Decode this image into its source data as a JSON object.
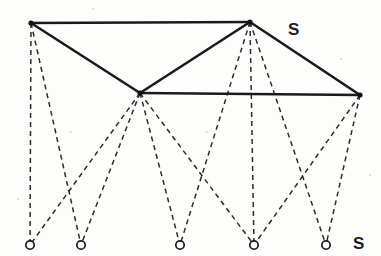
{
  "figure": {
    "width": 381,
    "height": 256,
    "background_color": "#fdfdfb",
    "solid_edge_color": "#1a1a1a",
    "dashed_edge_color": "#2b2b2b",
    "mesh_node_color": "#111111",
    "terminal_node_fill": "#ffffff",
    "terminal_node_stroke": "#1a1a1a"
  },
  "labels": {
    "upper_right": "S",
    "lower_right": "S"
  },
  "chart_data": {
    "type": "diagram",
    "xlabel": "",
    "ylabel": "",
    "mesh_nodes": [
      {
        "id": "n1",
        "name": "top-left-node",
        "x": 31,
        "y": 23
      },
      {
        "id": "n2",
        "name": "middle-node",
        "x": 140,
        "y": 93
      },
      {
        "id": "n3",
        "name": "apex-node",
        "x": 250,
        "y": 22
      },
      {
        "id": "n4",
        "name": "right-node",
        "x": 360,
        "y": 95
      }
    ],
    "terminal_nodes": [
      {
        "id": "c1",
        "name": "terminal-node-1",
        "x": 30,
        "y": 245,
        "r": 4.2
      },
      {
        "id": "c2",
        "name": "terminal-node-2",
        "x": 81,
        "y": 245,
        "r": 4.2
      },
      {
        "id": "c3",
        "name": "terminal-node-3",
        "x": 180,
        "y": 245,
        "r": 4.2
      },
      {
        "id": "c4",
        "name": "terminal-node-4",
        "x": 254,
        "y": 245,
        "r": 4.2
      },
      {
        "id": "c5",
        "name": "terminal-node-5",
        "x": 326,
        "y": 245,
        "r": 4.2
      }
    ],
    "solid_edges": [
      {
        "from": "n1",
        "to": "n3"
      },
      {
        "from": "n1",
        "to": "n2"
      },
      {
        "from": "n2",
        "to": "n3"
      },
      {
        "from": "n2",
        "to": "n4"
      },
      {
        "from": "n3",
        "to": "n4"
      }
    ],
    "dashed_edges": [
      {
        "from": "n1",
        "to": "c1"
      },
      {
        "from": "n1",
        "to": "c2"
      },
      {
        "from": "n2",
        "to": "c1"
      },
      {
        "from": "n2",
        "to": "c2"
      },
      {
        "from": "n2",
        "to": "c3"
      },
      {
        "from": "n2",
        "to": "c4"
      },
      {
        "from": "n3",
        "to": "c3"
      },
      {
        "from": "n3",
        "to": "c4"
      },
      {
        "from": "n3",
        "to": "c5"
      },
      {
        "from": "n4",
        "to": "c4"
      },
      {
        "from": "n4",
        "to": "c5"
      }
    ],
    "annotations": [
      {
        "text": "S",
        "x": 288,
        "y": 21,
        "name": "label-upper-right"
      },
      {
        "text": "S",
        "x": 353,
        "y": 235,
        "name": "label-lower-right"
      }
    ]
  },
  "specks": [
    {
      "x": 340,
      "y": 58,
      "size": 2
    },
    {
      "x": 369,
      "y": 174,
      "size": 2
    },
    {
      "x": 92,
      "y": 8,
      "size": 2
    },
    {
      "x": 206,
      "y": 131,
      "size": 2
    },
    {
      "x": 70,
      "y": 131,
      "size": 2
    },
    {
      "x": 17,
      "y": 198,
      "size": 2
    }
  ]
}
